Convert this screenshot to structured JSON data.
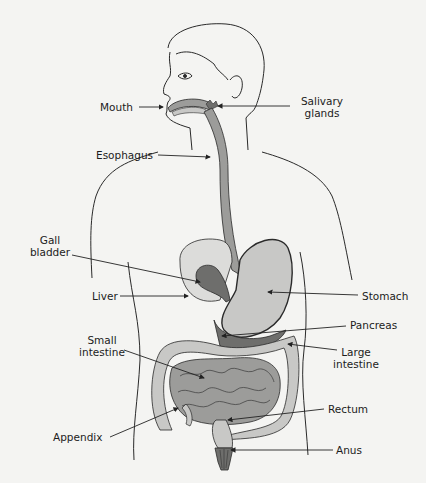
{
  "diagram": {
    "colors": {
      "background": "#f4f4f2",
      "outline": "#2a2a2a",
      "organ_light": "#c8c8c6",
      "organ_mid": "#9c9c9a",
      "organ_dark": "#6e6e6c",
      "liver": "#dcdcda"
    },
    "labels": {
      "mouth": "Mouth",
      "salivary_1": "Salivary",
      "salivary_2": "glands",
      "esophagus": "Esophagus",
      "gall_1": "Gall",
      "gall_2": "bladder",
      "liver": "Liver",
      "stomach": "Stomach",
      "pancreas": "Pancreas",
      "small_1": "Small",
      "small_2": "intestine",
      "large_1": "Large",
      "large_2": "intestine",
      "rectum": "Rectum",
      "appendix": "Appendix",
      "anus": "Anus"
    }
  }
}
